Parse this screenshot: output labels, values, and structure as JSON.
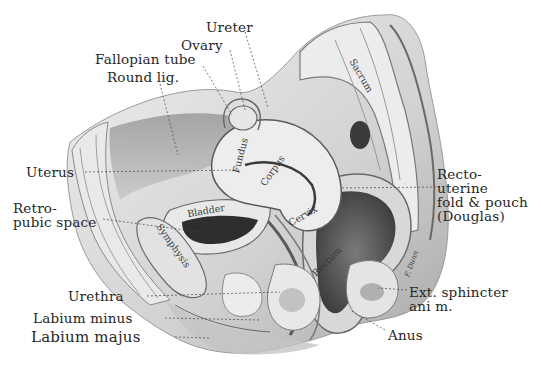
{
  "figure": {
    "colors": {
      "background": "#ffffff",
      "tissue_light": "#e6e6e6",
      "tissue_mid": "#b8b8b8",
      "tissue_dark": "#5a5a5a",
      "cavity_dark": "#2e2e2e",
      "leader_line": "#444444",
      "label_text": "#262626"
    }
  },
  "labels": {
    "ureter": "Ureter",
    "ovary": "Ovary",
    "fallopian_tube": "Fallopian tube",
    "round_lig": "Round lig.",
    "uterus": "Uterus",
    "retropubic_1": "Retro-",
    "retropubic_2": "pubic space",
    "recto_1": "Recto-",
    "recto_2": "uterine",
    "recto_3": "fold & pouch",
    "recto_4": "(Douglas)",
    "urethra": "Urethra",
    "labium_minus": "Labium minus",
    "labium_majus": "Labium majus",
    "ext_sphincter_1": "Ext. sphincter",
    "ext_sphincter_2": "ani m.",
    "anus": "Anus"
  },
  "inline_labels": {
    "sacrum": "Sacrum",
    "fundus": "Fundus",
    "corpus": "Corpus",
    "cervix": "Cervix",
    "bladder": "Bladder",
    "symphysis": "Symphysis",
    "rectum": "Rectum",
    "signature": "F. Dunn"
  }
}
